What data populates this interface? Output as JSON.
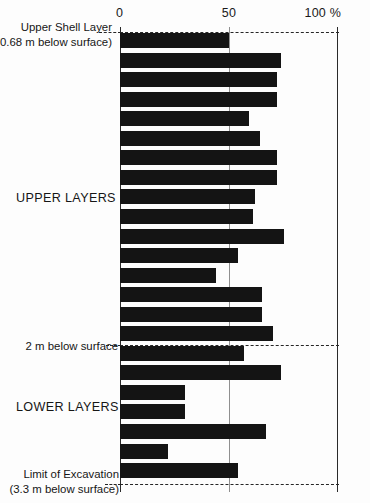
{
  "chart_data": {
    "type": "bar",
    "orientation": "horizontal",
    "title": "",
    "xlabel": "%",
    "ylabel": "",
    "xlim": [
      0,
      100
    ],
    "xticks": [
      0,
      50,
      100
    ],
    "xtick_labels": [
      "0",
      "50",
      "100 %"
    ],
    "grid": false,
    "legend": null,
    "bar_color": "#141414",
    "categories": [
      "1",
      "2",
      "3",
      "4",
      "5",
      "6",
      "7",
      "8",
      "9",
      "10",
      "11",
      "12",
      "13",
      "14",
      "15",
      "16",
      "17",
      "18",
      "19",
      "20",
      "21",
      "22",
      "23"
    ],
    "values": [
      50,
      74,
      72,
      72,
      59,
      64,
      72,
      72,
      62,
      61,
      75,
      54,
      44,
      65,
      65,
      70,
      57,
      74,
      30,
      30,
      67,
      22,
      54
    ],
    "annotations": [
      {
        "name": "upper-shell-layer",
        "text_lines": [
          "Upper Shell Layer",
          "(0.68 m below surface)"
        ],
        "value_percent": 0,
        "depth_m": 0.68,
        "kind": "depth-marker"
      },
      {
        "name": "two-m-below-surface",
        "text_lines": [
          "2 m below surface"
        ],
        "depth_m": 2.0,
        "kind": "depth-marker"
      },
      {
        "name": "limit-of-excavation",
        "text_lines": [
          "Limit of Excavation",
          "(3.3 m below surface)"
        ],
        "depth_m": 3.3,
        "kind": "depth-marker"
      },
      {
        "name": "upper-layers",
        "text_lines": [
          "UPPER LAYERS"
        ],
        "kind": "group-label"
      },
      {
        "name": "lower-layers",
        "text_lines": [
          "LOWER LAYERS"
        ],
        "kind": "group-label"
      }
    ]
  },
  "axis": {
    "tick_0": "0",
    "tick_50": "50",
    "tick_100": "100 %"
  },
  "labels": {
    "upper_shell_line1": "Upper Shell Layer",
    "upper_shell_line2": "(0.68 m below surface)",
    "upper_layers": "UPPER LAYERS",
    "two_m_below": "2 m below surface",
    "lower_layers": "LOWER LAYERS",
    "limit_line1": "Limit of Excavation",
    "limit_line2": "(3.3 m below surface)"
  },
  "colors": {
    "bar": "#141414",
    "axis": "#2a2a2a",
    "guide": "#8f8f8f",
    "background": "#fdfdfd"
  }
}
